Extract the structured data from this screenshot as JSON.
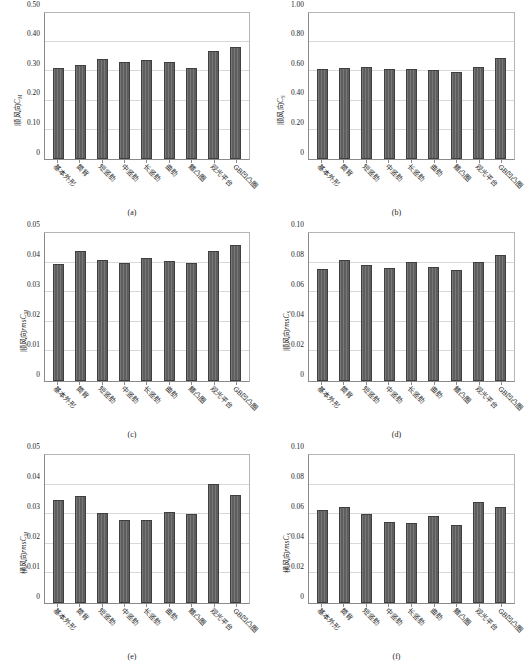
{
  "figure": {
    "categories": [
      "基本外形",
      "筒背",
      "短竖肋",
      "中竖肋",
      "长竖肋",
      "曲肋",
      "鳍凸圈",
      "观光平台",
      "GB凹凸圈"
    ],
    "bar_color": "#5e5e5e",
    "bar_edge_color": "#3f3f3f",
    "grid_color": "#d9d9d9",
    "axis_color": "#8a8a8a"
  },
  "chart_data": [
    {
      "type": "bar",
      "panel": "(a)",
      "title": "",
      "xlabel": "",
      "ylabel": "顺风向C_M",
      "ylabel_prefix": "顺风向",
      "ylabel_italic": "C",
      "ylabel_sub": "M",
      "categories": [
        "基本外形",
        "筒背",
        "短竖肋",
        "中竖肋",
        "长竖肋",
        "曲肋",
        "鳍凸圈",
        "观光平台",
        "GB凹凸圈"
      ],
      "values": [
        0.31,
        0.321,
        0.342,
        0.333,
        0.338,
        0.333,
        0.31,
        0.371,
        0.385
      ],
      "ylim": [
        0,
        0.5
      ],
      "yticks": [
        0,
        0.1,
        0.2,
        0.3,
        0.4,
        0.5
      ],
      "ytick_labels": [
        "0",
        "0.10",
        "0.20",
        "0.30",
        "0.40",
        "0.50"
      ],
      "grid": true,
      "legend": "none"
    },
    {
      "type": "bar",
      "panel": "(b)",
      "title": "",
      "xlabel": "",
      "ylabel": "顺风向C_S",
      "ylabel_prefix": "顺风向",
      "ylabel_italic": "C",
      "ylabel_sub": "S",
      "categories": [
        "基本外形",
        "筒背",
        "短竖肋",
        "中竖肋",
        "长竖肋",
        "曲肋",
        "鳍凸圈",
        "观光平台",
        "GB凹凸圈"
      ],
      "values": [
        0.617,
        0.623,
        0.627,
        0.614,
        0.614,
        0.613,
        0.599,
        0.632,
        0.69
      ],
      "ylim": [
        0,
        1.0
      ],
      "yticks": [
        0,
        0.2,
        0.4,
        0.6,
        0.8,
        1.0
      ],
      "ytick_labels": [
        "0",
        "0.20",
        "0.40",
        "0.60",
        "0.80",
        "1.00"
      ],
      "grid": true,
      "legend": "none"
    },
    {
      "type": "bar",
      "panel": "(c)",
      "title": "",
      "xlabel": "",
      "ylabel": "顺风向rmsC_M",
      "ylabel_prefix": "顺风向",
      "ylabel_italic": "rmsC",
      "ylabel_sub": "M",
      "categories": [
        "基本外形",
        "筒背",
        "短竖肋",
        "中竖肋",
        "长竖肋",
        "曲肋",
        "鳍凸圈",
        "观光平台",
        "GB凹凸圈"
      ],
      "values": [
        0.0397,
        0.044,
        0.0408,
        0.0398,
        0.0417,
        0.0405,
        0.0399,
        0.044,
        0.0459
      ],
      "ylim": [
        0,
        0.05
      ],
      "yticks": [
        0,
        0.01,
        0.02,
        0.03,
        0.04,
        0.05
      ],
      "ytick_labels": [
        "0",
        "0.01",
        "0.02",
        "0.03",
        "0.04",
        "0.05"
      ],
      "grid": true,
      "legend": "none"
    },
    {
      "type": "bar",
      "panel": "(d)",
      "title": "",
      "xlabel": "",
      "ylabel": "顺风向rmsC_S",
      "ylabel_prefix": "顺风向",
      "ylabel_italic": "rmsC",
      "ylabel_sub": "S",
      "categories": [
        "基本外形",
        "筒背",
        "短竖肋",
        "中竖肋",
        "长竖肋",
        "曲肋",
        "鳍凸圈",
        "观光平台",
        "GB凹凸圈"
      ],
      "values": [
        0.0755,
        0.0821,
        0.0787,
        0.0765,
        0.0807,
        0.0768,
        0.0752,
        0.0803,
        0.0852
      ],
      "ylim": [
        0,
        0.1
      ],
      "yticks": [
        0,
        0.02,
        0.04,
        0.06,
        0.08,
        0.1
      ],
      "ytick_labels": [
        "0",
        "0.02",
        "0.04",
        "0.06",
        "0.08",
        "0.10"
      ],
      "grid": true,
      "legend": "none"
    },
    {
      "type": "bar",
      "panel": "(e)",
      "title": "",
      "xlabel": "",
      "ylabel": "横风向rmsC_M",
      "ylabel_prefix": "横风向",
      "ylabel_italic": "rmsC",
      "ylabel_sub": "M",
      "categories": [
        "基本外形",
        "筒背",
        "短竖肋",
        "中竖肋",
        "长竖肋",
        "曲肋",
        "鳍凸圈",
        "观光平台",
        "GB凹凸圈"
      ],
      "values": [
        0.0349,
        0.036,
        0.0305,
        0.0282,
        0.0281,
        0.0307,
        0.03,
        0.0401,
        0.0366
      ],
      "ylim": [
        0,
        0.05
      ],
      "yticks": [
        0,
        0.01,
        0.02,
        0.03,
        0.04,
        0.05
      ],
      "ytick_labels": [
        "0",
        "0.01",
        "0.02",
        "0.03",
        "0.04",
        "0.05"
      ],
      "grid": true,
      "legend": "none"
    },
    {
      "type": "bar",
      "panel": "(f)",
      "title": "",
      "xlabel": "",
      "ylabel": "横风向rmsC_S",
      "ylabel_prefix": "横风向",
      "ylabel_italic": "rmsC",
      "ylabel_sub": "S",
      "categories": [
        "基本外形",
        "筒背",
        "短竖肋",
        "中竖肋",
        "长竖肋",
        "曲肋",
        "鳍凸圈",
        "观光平台",
        "GB凹凸圈"
      ],
      "values": [
        0.0627,
        0.0652,
        0.0602,
        0.0549,
        0.0539,
        0.059,
        0.0527,
        0.0682,
        0.0648
      ],
      "ylim": [
        0,
        0.1
      ],
      "yticks": [
        0,
        0.02,
        0.04,
        0.06,
        0.08,
        0.1
      ],
      "ytick_labels": [
        "0",
        "0.02",
        "0.04",
        "0.06",
        "0.08",
        "0.10"
      ],
      "grid": true,
      "legend": "none"
    }
  ]
}
